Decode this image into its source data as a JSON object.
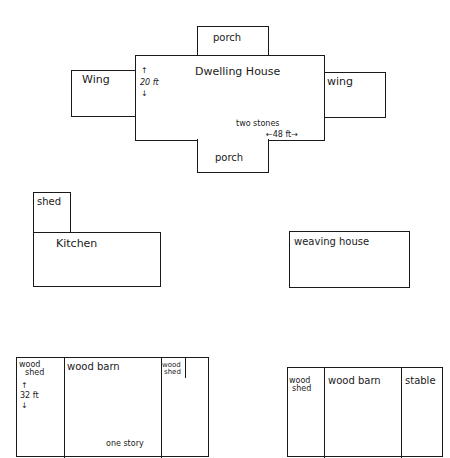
{
  "diagram": {
    "type": "site-plan",
    "buildings": {
      "dwelling_house": {
        "label": "Dwelling House",
        "height_note": "20 ft",
        "width_note": "48 ft",
        "stories_note": "two stones",
        "arrow_up": "↑",
        "arrow_down": "↓",
        "arrow_left": "←",
        "arrow_right": "→"
      },
      "porch_top": {
        "label": "porch"
      },
      "porch_bottom": {
        "label": "porch"
      },
      "wing_left": {
        "label": "Wing"
      },
      "wing_right": {
        "label": "wing"
      },
      "shed": {
        "label": "shed"
      },
      "kitchen": {
        "label": "Kitchen"
      },
      "weaving_house": {
        "label": "weaving house"
      },
      "barn_left": {
        "sections": [
          {
            "label_line1": "wood",
            "label_line2": "shed"
          },
          {
            "label": "wood barn"
          },
          {
            "label_line1": "wood",
            "label_line2": "shed"
          }
        ],
        "height_note": "32 ft",
        "stories_note": "one story",
        "arrow_up": "↑",
        "arrow_down": "↓"
      },
      "barn_right": {
        "sections": [
          {
            "label_line1": "wood",
            "label_line2": "shed"
          },
          {
            "label": "wood barn"
          },
          {
            "label": "stable"
          }
        ]
      }
    }
  }
}
